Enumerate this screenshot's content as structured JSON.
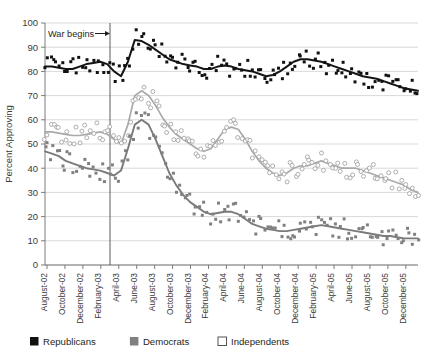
{
  "chart_data": {
    "type": "scatter",
    "title": "",
    "xlabel": "",
    "ylabel": "Percent Approving",
    "ylim": [
      0,
      100
    ],
    "yticks": [
      0,
      10,
      20,
      30,
      40,
      50,
      60,
      70,
      80,
      90,
      100
    ],
    "grid": true,
    "legend_position": "bottom-left",
    "annotations": [
      {
        "text": "War begins",
        "x": "March-03",
        "arrow": "right"
      }
    ],
    "categories": [
      "August-02",
      "October-02",
      "December-02",
      "February-03",
      "April-03",
      "June-03",
      "August-03",
      "October-03",
      "December-03",
      "February-04",
      "April-04",
      "June-04",
      "August-04",
      "October-04",
      "December-04",
      "February-05",
      "April-05",
      "June-05",
      "August-05",
      "October-05",
      "December-05"
    ],
    "x_tick_labels": [
      "August-02",
      "October-02",
      "December-02",
      "February-03",
      "April-03",
      "June-03",
      "August-03",
      "October-03",
      "December-03",
      "February-04",
      "April-04",
      "June-04",
      "August-04",
      "October-04",
      "December-04",
      "February-05",
      "April-05",
      "June-05",
      "August-05",
      "October-05",
      "December-05"
    ],
    "series": [
      {
        "name": "Republicans",
        "marker": "filled-square",
        "color": "#111111",
        "trend": [
          82,
          82,
          81.5,
          81,
          81,
          82,
          83,
          83.5,
          84,
          83,
          80,
          78,
          84,
          93,
          92.5,
          91,
          89,
          87,
          85,
          84,
          83,
          82.5,
          82,
          81,
          81,
          82,
          82.5,
          82,
          81,
          80.5,
          80,
          79,
          78,
          78.5,
          80,
          82,
          84,
          85,
          85,
          84.5,
          84,
          83,
          82,
          81,
          80,
          79,
          78,
          77.5,
          77,
          76,
          75,
          74,
          73,
          72.5,
          72
        ],
        "points_y": [
          83,
          81,
          82,
          80,
          88,
          83,
          81,
          83,
          84,
          85,
          82,
          80,
          79,
          77,
          76,
          92,
          93,
          91,
          90,
          92,
          93,
          92,
          88,
          87,
          85,
          83,
          89,
          88,
          86,
          84,
          82,
          85,
          84,
          83,
          80,
          78,
          82,
          79,
          77,
          81,
          83,
          86,
          82,
          80,
          90,
          88,
          84,
          86,
          83,
          82,
          85,
          84,
          81,
          79,
          78,
          77,
          75,
          74,
          80,
          76,
          72,
          71,
          73,
          75,
          72,
          70
        ]
      },
      {
        "name": "Independents",
        "marker": "open-circle",
        "color": "#a9a9a9",
        "trend": [
          55,
          55,
          54.5,
          54,
          53.5,
          53.5,
          54,
          54.5,
          55,
          54,
          52,
          50,
          58,
          70,
          72,
          70,
          66,
          61,
          57,
          54,
          52,
          50,
          48,
          47,
          48,
          52,
          56,
          57,
          56,
          52,
          47,
          43,
          40,
          38,
          37,
          38,
          40,
          41,
          41,
          42,
          43,
          42,
          41,
          40,
          40,
          40,
          39,
          38,
          37,
          36,
          35,
          34,
          33,
          31,
          30
        ]
      },
      {
        "name": "Democrats",
        "marker": "filled-square",
        "color": "#808080",
        "trend": [
          47,
          46,
          45,
          43,
          42,
          41,
          40,
          39.5,
          39,
          38,
          37,
          39,
          48,
          58,
          60,
          58,
          52,
          45,
          38,
          33,
          29,
          26,
          24,
          22,
          21,
          21.5,
          22,
          22,
          21,
          19,
          17,
          16,
          15,
          14.5,
          14,
          14,
          14.5,
          15,
          15.5,
          16,
          16.5,
          16,
          15.5,
          15,
          14.5,
          14,
          13.5,
          13,
          12.5,
          12,
          12,
          11.5,
          11,
          11,
          11
        ]
      }
    ]
  },
  "legend": {
    "items": [
      {
        "label": "Republicans",
        "swatch": "#111111",
        "style": "filled"
      },
      {
        "label": "Democrats",
        "swatch": "#808080",
        "style": "filled"
      },
      {
        "label": "Independents",
        "swatch": "#ffffff",
        "style": "outlined"
      }
    ]
  },
  "axis": {
    "y_label": "Percent Approving",
    "y_ticks": [
      "100",
      "90",
      "80",
      "70",
      "60",
      "50",
      "40",
      "30",
      "20",
      "10",
      "0"
    ]
  },
  "annotation": {
    "war_begins": "War begins"
  }
}
